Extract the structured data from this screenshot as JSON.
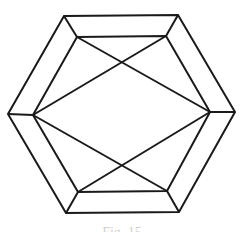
{
  "diagram": {
    "stroke_color": "#1a1a1a",
    "stroke_width": 2,
    "outer_hexagon": [
      [
        64,
        16
      ],
      [
        178,
        15
      ],
      [
        235,
        112
      ],
      [
        179,
        212
      ],
      [
        66,
        213
      ],
      [
        8,
        114
      ]
    ],
    "inner_octagon": [
      [
        77,
        37
      ],
      [
        166,
        36
      ],
      [
        210,
        112
      ],
      [
        167,
        191
      ],
      [
        78,
        192
      ],
      [
        33,
        115
      ]
    ],
    "connectors": [
      [
        [
          64,
          16
        ],
        [
          77,
          37
        ]
      ],
      [
        [
          178,
          15
        ],
        [
          166,
          36
        ]
      ],
      [
        [
          235,
          112
        ],
        [
          210,
          112
        ]
      ],
      [
        [
          179,
          212
        ],
        [
          167,
          191
        ]
      ],
      [
        [
          66,
          213
        ],
        [
          78,
          192
        ]
      ],
      [
        [
          8,
          114
        ],
        [
          33,
          115
        ]
      ]
    ],
    "diagonals": [
      [
        [
          77,
          37
        ],
        [
          210,
          112
        ]
      ],
      [
        [
          166,
          36
        ],
        [
          33,
          115
        ]
      ],
      [
        [
          33,
          115
        ],
        [
          167,
          191
        ]
      ],
      [
        [
          210,
          112
        ],
        [
          78,
          192
        ]
      ]
    ]
  },
  "caption": "Fig. 15"
}
